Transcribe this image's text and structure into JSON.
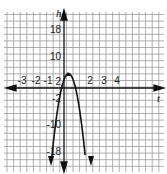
{
  "chart_data": {
    "type": "line",
    "title": "",
    "xlabel": "t",
    "ylabel": "h",
    "function": "h = -16t^2 + 12t + 2",
    "x_tick_labels": [
      "-3",
      "-2",
      "-1",
      "2",
      "3",
      "4"
    ],
    "x_ticks": [
      -3,
      -2,
      -1,
      2,
      3,
      4
    ],
    "y_tick_labels": [
      "18",
      "10",
      "2",
      "-2",
      "-10",
      "-18"
    ],
    "y_ticks": [
      18,
      10,
      2,
      -2,
      -10,
      -18
    ],
    "xlim": [
      -4,
      7
    ],
    "ylim": [
      -24,
      22
    ],
    "grid": true,
    "legend": null,
    "series": [
      {
        "name": "parabola",
        "x": [
          -0.9,
          -0.7,
          -0.5,
          -0.25,
          0,
          0.2,
          0.375,
          0.55,
          0.75,
          1.0,
          1.25,
          1.6,
          2.1
        ],
        "y": [
          -21.8,
          -14.2,
          -8.0,
          -2.0,
          2.0,
          3.76,
          4.25,
          3.76,
          2.0,
          -2.0,
          -8.0,
          -19.8,
          -43.4
        ]
      }
    ],
    "vertex": {
      "t": 0.375,
      "h": 4.25
    },
    "annotations": [
      "arrow down at left end of curve",
      "arrow down at right end of curve",
      "arrow down on h-axis (negative direction)"
    ]
  },
  "labels": {
    "x_axis": "t",
    "y_axis": "h",
    "x_ticks": [
      {
        "text": "-3",
        "x": 22
      },
      {
        "text": "-2",
        "x": 36
      },
      {
        "text": "-1",
        "x": 48
      },
      {
        "text": "2",
        "x": 90
      },
      {
        "text": "3",
        "x": 104
      },
      {
        "text": "4",
        "x": 117
      }
    ],
    "y_ticks": [
      {
        "text": "18",
        "y": 33
      },
      {
        "text": "10",
        "y": 60
      },
      {
        "text": "2",
        "y": 85
      },
      {
        "text": "-2",
        "y": 102
      },
      {
        "text": "-10",
        "y": 128
      },
      {
        "text": "-18",
        "y": 155
      }
    ]
  },
  "colors": {
    "grid": "#9a9a9a",
    "axis": "#111111",
    "curve": "#111111",
    "background": "#ffffff"
  }
}
